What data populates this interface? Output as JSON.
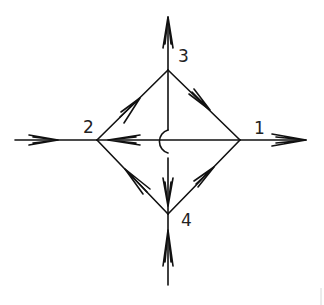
{
  "diagram": {
    "type": "directed-network",
    "nodes": [
      {
        "id": "1",
        "label": "1",
        "x": 240,
        "y": 140,
        "label_x": 254,
        "label_y": 134
      },
      {
        "id": "2",
        "label": "2",
        "x": 97,
        "y": 140,
        "label_x": 83,
        "label_y": 133
      },
      {
        "id": "3",
        "label": "3",
        "x": 168,
        "y": 70,
        "label_x": 178,
        "label_y": 62
      },
      {
        "id": "4",
        "label": "4",
        "x": 168,
        "y": 214,
        "label_x": 181,
        "label_y": 226
      }
    ],
    "edges": [
      {
        "from": "3",
        "to": "1",
        "description": "upper-right side, arrow toward 1"
      },
      {
        "from": "2",
        "to": "3",
        "description": "upper-left side, arrow toward 3"
      },
      {
        "from": "1",
        "to": "2",
        "description": "horizontal diagonal, arrow toward 2"
      },
      {
        "from": "4",
        "to": "2",
        "description": "lower-left side, arrow toward 2"
      },
      {
        "from": "4",
        "to": "1",
        "description": "lower-right side, arrow toward 1"
      },
      {
        "from": "3",
        "to": "4",
        "description": "vertical diagonal with crossover hop over edge 1-2, arrow toward 4"
      }
    ],
    "external_flows": [
      {
        "node": "2",
        "direction": "in",
        "side": "left",
        "description": "source arrow entering node 2 from the left"
      },
      {
        "node": "1",
        "direction": "out",
        "side": "right",
        "description": "sink arrow leaving node 1 to the right"
      },
      {
        "node": "3",
        "direction": "out",
        "side": "top",
        "description": "sink arrow leaving node 3 upward"
      },
      {
        "node": "4",
        "direction": "in",
        "side": "bottom",
        "description": "source arrow entering node 4 from below"
      }
    ],
    "crossing": {
      "type": "hop",
      "at": "center",
      "description": "vertical edge 3-4 jumps over horizontal edge 1-2 with a semicircle bulging left"
    }
  }
}
